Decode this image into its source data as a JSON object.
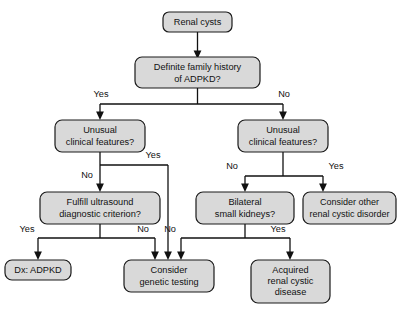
{
  "diagram": {
    "colors": {
      "node_fill": "#d9d9d9",
      "node_stroke": "#1a1a1a",
      "line": "#111111",
      "text": "#111111",
      "background": "#ffffff"
    },
    "nodes": {
      "renal_cysts": {
        "line1": "Renal cysts"
      },
      "family_history": {
        "line1": "Definite family history",
        "line2": "of ADPKD?"
      },
      "unusual_left": {
        "line1": "Unusual",
        "line2": "clinical features?"
      },
      "unusual_right": {
        "line1": "Unusual",
        "line2": "clinical features?"
      },
      "ultrasound": {
        "line1": "Fulfill ultrasound",
        "line2": "diagnostic criterion?"
      },
      "bilateral": {
        "line1": "Bilateral",
        "line2": "small kidneys?"
      },
      "consider_other": {
        "line1": "Consider other",
        "line2": "renal cystic disorder"
      },
      "dx_adpkd": {
        "line1": "Dx: ADPKD"
      },
      "genetic_testing": {
        "line1": "Consider",
        "line2": "genetic testing"
      },
      "acquired": {
        "line1": "Acquired",
        "line2": "renal cystic",
        "line3": "disease"
      }
    },
    "edge_labels": {
      "fh_yes": "Yes",
      "fh_no": "No",
      "ul_no": "No",
      "ul_yes": "Yes",
      "ur_no": "No",
      "ur_yes": "Yes",
      "us_yes": "Yes",
      "us_no": "No",
      "bk_no": "No",
      "bk_yes": "Yes"
    }
  }
}
